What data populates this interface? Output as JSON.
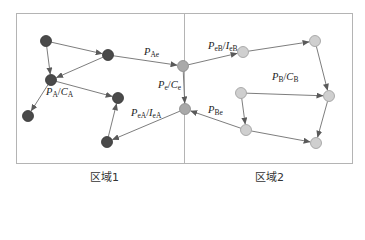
{
  "diagram": {
    "regions": [
      {
        "id": "region1",
        "label": "区域1",
        "node_color": "#4a4a4a"
      },
      {
        "id": "region2",
        "label": "区域2",
        "node_color": "#cfcfcf"
      }
    ],
    "boundary_color": "#b4b4b4",
    "edge_color": "#6e6e6e",
    "labels": {
      "p_ae": {
        "main": "P",
        "sub": "Ae"
      },
      "p_e_c_e": {
        "main": "P",
        "sub": "e",
        "sep": "/",
        "main2": "C",
        "sub2": "e"
      },
      "p_a_c_a": {
        "main": "P",
        "sub": "A",
        "sep": "/",
        "main2": "C",
        "sub2": "A"
      },
      "p_ea_i_ea": {
        "main": "P",
        "sub": "eA",
        "sep": "/",
        "main2": "I",
        "sub2": "eA"
      },
      "p_eb_i_eb": {
        "main": "P",
        "sub": "eB",
        "sep": "/",
        "main2": "I",
        "sub2": "eB"
      },
      "p_b_c_b": {
        "main": "P",
        "sub": "B",
        "sep": "/",
        "main2": "C",
        "sub2": "B"
      },
      "p_be": {
        "main": "P",
        "sub": "Be"
      }
    },
    "nodes": [
      {
        "id": "a1",
        "region": "region1",
        "x": 46,
        "y": 41
      },
      {
        "id": "a2",
        "region": "region1",
        "x": 108,
        "y": 55
      },
      {
        "id": "a3",
        "region": "region1",
        "x": 51,
        "y": 80
      },
      {
        "id": "a4",
        "region": "region1",
        "x": 28,
        "y": 116
      },
      {
        "id": "a5",
        "region": "region1",
        "x": 118,
        "y": 98
      },
      {
        "id": "a6",
        "region": "region1",
        "x": 107,
        "y": 142
      },
      {
        "id": "e1",
        "region": "boundary",
        "x": 183,
        "y": 66
      },
      {
        "id": "e2",
        "region": "boundary",
        "x": 185,
        "y": 109
      },
      {
        "id": "b1",
        "region": "region2",
        "x": 243,
        "y": 52
      },
      {
        "id": "b2",
        "region": "region2",
        "x": 315,
        "y": 41
      },
      {
        "id": "b3",
        "region": "region2",
        "x": 329,
        "y": 96
      },
      {
        "id": "b4",
        "region": "region2",
        "x": 241,
        "y": 93
      },
      {
        "id": "b5",
        "region": "region2",
        "x": 246,
        "y": 130
      },
      {
        "id": "b6",
        "region": "region2",
        "x": 316,
        "y": 143
      }
    ],
    "edges": [
      {
        "from": "a1",
        "to": "a2"
      },
      {
        "from": "a1",
        "to": "a3"
      },
      {
        "from": "a2",
        "to": "a3"
      },
      {
        "from": "a3",
        "to": "a4"
      },
      {
        "from": "a3",
        "to": "a5"
      },
      {
        "from": "a6",
        "to": "a5"
      },
      {
        "from": "a2",
        "to": "e1"
      },
      {
        "from": "e1",
        "to": "e2"
      },
      {
        "from": "e1",
        "to": "b1"
      },
      {
        "from": "e2",
        "to": "a6"
      },
      {
        "from": "b1",
        "to": "b2"
      },
      {
        "from": "b2",
        "to": "b3"
      },
      {
        "from": "b4",
        "to": "b3"
      },
      {
        "from": "b4",
        "to": "b5"
      },
      {
        "from": "b3",
        "to": "b6"
      },
      {
        "from": "b5",
        "to": "b6"
      },
      {
        "from": "b5",
        "to": "e2"
      }
    ]
  }
}
